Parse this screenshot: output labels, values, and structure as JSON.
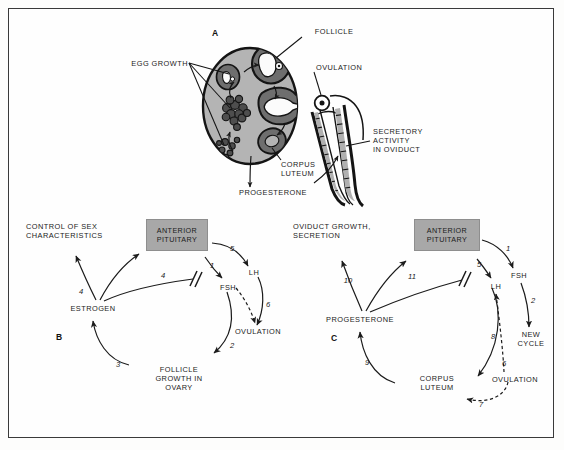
{
  "figure": {
    "panels": [
      {
        "letter": "A",
        "name": "ovary-and-oviduct-anatomy"
      },
      {
        "letter": "B",
        "name": "follicular-phase-feedback-loop"
      },
      {
        "letter": "C",
        "name": "luteal-phase-feedback-loop"
      }
    ]
  },
  "panel_a": {
    "letter": "A",
    "labels": {
      "follicle": "FOLLICLE",
      "egg_growth": "EGG GROWTH",
      "ovulation": "OVULATION",
      "secretory_activity": "SECRETORY\nACTIVITY\nIN OVIDUCT",
      "corpus_luteum": "CORPUS\nLUTEUM",
      "progesterone": "PROGESTERONE"
    },
    "colors": {
      "ovary_fill": "#b4b4b4",
      "follicle_fill": "#6e6e6e",
      "outline": "#141414",
      "oviduct_fill": "#b0b0b0"
    }
  },
  "panel_b": {
    "letter": "B",
    "nodes": {
      "control_of_sex": "CONTROL OF SEX\nCHARACTERISTICS",
      "anterior_pituitary": "ANTERIOR\nPITUITARY",
      "estrogen": "ESTROGEN",
      "fsh": "FSH",
      "lh": "LH",
      "ovulation": "OVULATION",
      "follicle_growth": "FOLLICLE\nGROWTH IN\nOVARY"
    },
    "step_numbers": [
      "1",
      "2",
      "3",
      "4",
      "4",
      "5",
      "6"
    ],
    "steps": [
      {
        "n": "1",
        "from": "anterior_pituitary",
        "to": "fsh"
      },
      {
        "n": "2",
        "from": "fsh",
        "to": "follicle_growth"
      },
      {
        "n": "3",
        "from": "follicle_growth",
        "to": "estrogen"
      },
      {
        "n": "4",
        "from": "estrogen",
        "to": "control_of_sex"
      },
      {
        "n": "4",
        "from": "estrogen",
        "to": "anterior_pituitary",
        "style": "inhibitory"
      },
      {
        "n": "5",
        "from": "anterior_pituitary",
        "to": "lh"
      },
      {
        "n": "6",
        "from": "lh",
        "to": "ovulation"
      }
    ]
  },
  "panel_c": {
    "letter": "C",
    "nodes": {
      "oviduct_growth": "OVIDUCT GROWTH,\nSECRETION",
      "anterior_pituitary": "ANTERIOR\nPITUITARY",
      "progesterone": "PROGESTERONE",
      "fsh": "FSH",
      "lh": "LH",
      "new_cycle": "NEW\nCYCLE",
      "ovulation": "OVULATION",
      "corpus_luteum": "CORPUS\nLUTEUM"
    },
    "step_numbers": [
      "1",
      "2",
      "5",
      "6",
      "7",
      "8",
      "9",
      "10",
      "11"
    ],
    "steps": [
      {
        "n": "1",
        "from": "anterior_pituitary",
        "to": "fsh"
      },
      {
        "n": "2",
        "from": "fsh",
        "to": "new_cycle"
      },
      {
        "n": "5",
        "from": "anterior_pituitary",
        "to": "lh"
      },
      {
        "n": "6",
        "from": "lh",
        "to": "ovulation",
        "style": "dashed"
      },
      {
        "n": "7",
        "from": "ovulation",
        "to": "corpus_luteum",
        "style": "dashed"
      },
      {
        "n": "8",
        "from": "lh",
        "to": "corpus_luteum"
      },
      {
        "n": "9",
        "from": "corpus_luteum",
        "to": "progesterone"
      },
      {
        "n": "10",
        "from": "progesterone",
        "to": "oviduct_growth"
      },
      {
        "n": "11",
        "from": "progesterone",
        "to": "anterior_pituitary",
        "style": "inhibitory"
      }
    ]
  },
  "colors": {
    "ink": "#1b1b1b",
    "pituitary_gray": "#a8a8a8",
    "page": "#fefefe",
    "border": "#3a3a3a"
  }
}
